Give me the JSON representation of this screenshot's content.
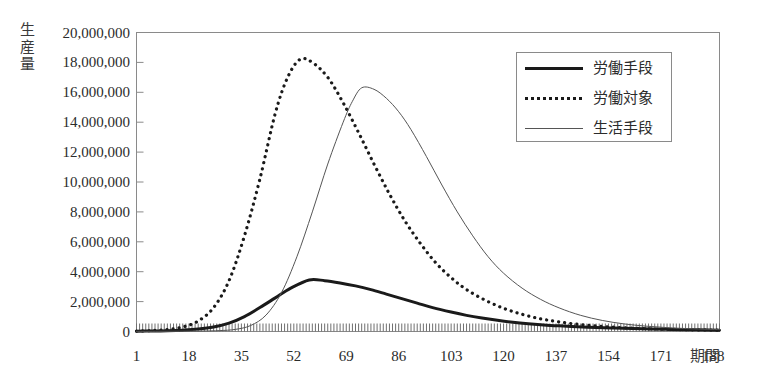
{
  "chart_data": {
    "type": "line",
    "title": "",
    "xlabel": "期間",
    "ylabel": "生産量",
    "xlim": [
      1,
      190
    ],
    "ylim": [
      0,
      20000000
    ],
    "grid": false,
    "legend_position": "top-right",
    "x_ticks": [
      "1",
      "18",
      "35",
      "52",
      "69",
      "86",
      "103",
      "120",
      "137",
      "154",
      "171",
      "188"
    ],
    "x_tick_values": [
      1,
      18,
      35,
      52,
      69,
      86,
      103,
      120,
      137,
      154,
      171,
      188
    ],
    "y_ticks": [
      "0",
      "2,000,000",
      "4,000,000",
      "6,000,000",
      "8,000,000",
      "10,000,000",
      "12,000,000",
      "14,000,000",
      "16,000,000",
      "18,000,000",
      "20,000,000"
    ],
    "y_tick_values": [
      0,
      2000000,
      4000000,
      6000000,
      8000000,
      10000000,
      12000000,
      14000000,
      16000000,
      18000000,
      20000000
    ],
    "series": [
      {
        "name": "労働手段",
        "style": "thick-solid",
        "color": "#1a1a1a",
        "peak_x": 57,
        "peak_y": 3450000,
        "x": [
          1,
          6,
          11,
          16,
          21,
          26,
          31,
          36,
          41,
          46,
          51,
          57,
          62,
          67,
          72,
          77,
          82,
          87,
          92,
          97,
          103,
          108,
          113,
          118,
          123,
          128,
          133,
          138,
          144,
          150,
          156,
          162,
          168,
          174,
          180,
          186,
          190
        ],
        "values": [
          20000,
          30000,
          50000,
          90000,
          160000,
          300000,
          560000,
          1000000,
          1600000,
          2250000,
          2900000,
          3450000,
          3400000,
          3250000,
          3050000,
          2800000,
          2500000,
          2200000,
          1900000,
          1600000,
          1300000,
          1080000,
          900000,
          750000,
          620000,
          520000,
          440000,
          380000,
          320000,
          270000,
          230000,
          195000,
          165000,
          140000,
          120000,
          100000,
          90000
        ]
      },
      {
        "name": "労働対象",
        "style": "dotted",
        "color": "#1a1a1a",
        "peak_x": 54,
        "peak_y": 18200000,
        "x": [
          1,
          6,
          11,
          16,
          21,
          26,
          31,
          36,
          41,
          46,
          50,
          54,
          58,
          63,
          68,
          73,
          78,
          83,
          88,
          93,
          98,
          103,
          108,
          114,
          120,
          126,
          132,
          138,
          145,
          152,
          159,
          166,
          173,
          180,
          186,
          190
        ],
        "values": [
          30000,
          60000,
          130000,
          300000,
          700000,
          1600000,
          3400000,
          6400000,
          10200000,
          14600000,
          17000000,
          18200000,
          18000000,
          17000000,
          15300000,
          13300000,
          11200000,
          9200000,
          7400000,
          5900000,
          4600000,
          3600000,
          2800000,
          2100000,
          1550000,
          1150000,
          850000,
          640000,
          460000,
          340000,
          250000,
          190000,
          150000,
          120000,
          100000,
          90000
        ]
      },
      {
        "name": "生活手段",
        "style": "thin-solid",
        "color": "#555555",
        "peak_x": 74,
        "peak_y": 16300000,
        "x": [
          1,
          8,
          15,
          22,
          28,
          33,
          38,
          43,
          48,
          53,
          58,
          63,
          68,
          71,
          74,
          78,
          82,
          86,
          90,
          95,
          100,
          105,
          110,
          115,
          120,
          126,
          132,
          138,
          145,
          152,
          159,
          166,
          173,
          180,
          186,
          190
        ],
        "values": [
          10000,
          12000,
          18000,
          30000,
          60000,
          140000,
          400000,
          1100000,
          2600000,
          5000000,
          8000000,
          11200000,
          14000000,
          15400000,
          16300000,
          16200000,
          15600000,
          14700000,
          13500000,
          11700000,
          9800000,
          8000000,
          6400000,
          5000000,
          3900000,
          2900000,
          2150000,
          1580000,
          1080000,
          740000,
          510000,
          360000,
          260000,
          190000,
          150000,
          130000
        ]
      }
    ]
  },
  "axis": {
    "y_title": "生\n産\n量",
    "x_title": "期間"
  },
  "legend": {
    "items": [
      {
        "label": "労働手段"
      },
      {
        "label": "労働対象"
      },
      {
        "label": "生活手段"
      }
    ]
  }
}
